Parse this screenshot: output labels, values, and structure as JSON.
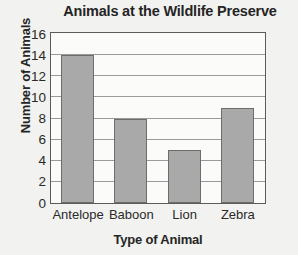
{
  "chart_data": {
    "type": "bar",
    "title": "Animals at the Wildlife Preserve",
    "xlabel": "Type of Animal",
    "ylabel": "Number of Animals",
    "categories": [
      "Antelope",
      "Baboon",
      "Lion",
      "Zebra"
    ],
    "values": [
      14,
      8,
      5,
      9
    ],
    "ylim": [
      0,
      16
    ],
    "ytick_step": 2,
    "yticks": [
      0,
      2,
      4,
      6,
      8,
      10,
      12,
      14,
      16
    ],
    "ytick_labels": [
      "0",
      "2",
      "4",
      "6",
      "8",
      "10",
      "12",
      "14",
      "16"
    ],
    "grid": true,
    "grid_axis": "y",
    "legend": false,
    "bar_color": "#a9a9a9",
    "bar_border_color": "#6d6d6d",
    "axis_color": "#5b5b5b",
    "gridline_color": "#9a9a9a",
    "text_color": "#252525",
    "plot_background": "#fbfbfa",
    "figure_background": "#f2f2f0"
  }
}
